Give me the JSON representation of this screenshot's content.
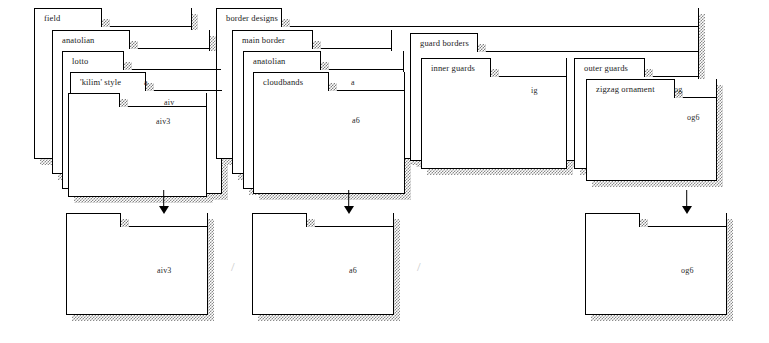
{
  "diagram": {
    "groups": [
      {
        "name": "field-group",
        "folders": [
          {
            "label": "field",
            "code": ""
          },
          {
            "label": "anatolian",
            "code": ""
          },
          {
            "label": "lotto",
            "code": "a"
          },
          {
            "label": "'kilim' style",
            "code": "aiv"
          }
        ],
        "leading_code": "aiv3",
        "result": {
          "label": "",
          "code": "aiv3"
        }
      },
      {
        "name": "border-designs-group",
        "folders": [
          {
            "label": "border designs",
            "code": ""
          },
          {
            "label": "main border",
            "code": ""
          },
          {
            "label": "anatolian",
            "code": "a"
          },
          {
            "label": "cloudbands",
            "code": ""
          }
        ],
        "leading_code": "a6",
        "result": {
          "label": "",
          "code": "a6"
        }
      },
      {
        "name": "guard-borders-group",
        "folders": [
          {
            "label": "guard borders",
            "code": ""
          },
          {
            "label": "inner guards",
            "code": "ig"
          }
        ],
        "leading_code": "ig",
        "result": null
      },
      {
        "name": "outer-guards-group",
        "folders": [
          {
            "label": "outer guards",
            "code": "og"
          },
          {
            "label": "zigzag ornament",
            "code": ""
          }
        ],
        "leading_code": "og6",
        "result": {
          "label": "",
          "code": "og6"
        }
      }
    ],
    "separators": [
      "/",
      "/"
    ],
    "arrow_glyph": "down-arrow"
  }
}
